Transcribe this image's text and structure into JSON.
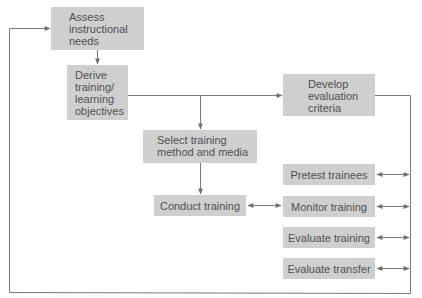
{
  "diagram": {
    "colors": {
      "box_fill": "#cfcfcf",
      "line": "#6e6e6e",
      "text": "#505050",
      "background": "#ffffff"
    },
    "nodes": {
      "assess": {
        "label": "Assess\ninstructional\nneeds"
      },
      "derive": {
        "label": "Derive\ntraining/\nlearning\nobjectives"
      },
      "develop": {
        "label": "Develop\nevaluation\ncriteria"
      },
      "select": {
        "label": "Select training\nmethod and media"
      },
      "conduct": {
        "label": "Conduct training"
      },
      "pretest": {
        "label": "Pretest trainees"
      },
      "monitor": {
        "label": "Monitor training"
      },
      "evaluate_training": {
        "label": "Evaluate training"
      },
      "evaluate_transfer": {
        "label": "Evaluate transfer"
      }
    },
    "edges": [
      {
        "from": "assess",
        "to": "derive",
        "type": "arrow"
      },
      {
        "from": "derive",
        "to": "develop",
        "type": "arrow"
      },
      {
        "from": "derive",
        "to": "select",
        "type": "arrow"
      },
      {
        "from": "select",
        "to": "conduct",
        "type": "arrow"
      },
      {
        "from": "conduct",
        "to": "monitor",
        "type": "bidirectional"
      },
      {
        "from": "develop",
        "to": "feedback-bus",
        "type": "line"
      },
      {
        "from": "pretest",
        "to": "feedback-bus",
        "type": "bidirectional"
      },
      {
        "from": "monitor",
        "to": "feedback-bus",
        "type": "bidirectional"
      },
      {
        "from": "evaluate_training",
        "to": "feedback-bus",
        "type": "bidirectional"
      },
      {
        "from": "evaluate_transfer",
        "to": "feedback-bus",
        "type": "bidirectional"
      },
      {
        "from": "feedback-bus",
        "to": "assess",
        "type": "arrow"
      }
    ]
  }
}
